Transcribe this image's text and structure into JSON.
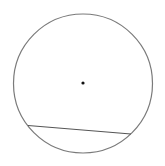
{
  "diagram": {
    "width": 165,
    "height": 166,
    "background": "#ffffff",
    "circle": {
      "cx": 83,
      "cy": 83.5,
      "r": 69.5,
      "stroke": "#7a7a7a",
      "stroke_width": 1.2
    },
    "center_point": {
      "cx": 83,
      "cy": 83,
      "r": 1.6,
      "fill": "#111111"
    },
    "chord": {
      "x1": 28,
      "y1": 125.5,
      "x2": 131,
      "y2": 134,
      "stroke": "#555555",
      "stroke_width": 1.2
    }
  }
}
